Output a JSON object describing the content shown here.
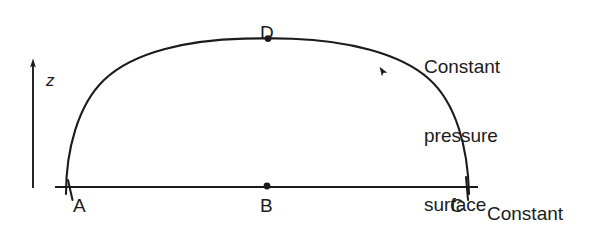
{
  "figure": {
    "type": "schematic-diagram",
    "background_color": "#ffffff",
    "ink_color": "#1b1b1b",
    "width": 606,
    "height": 229
  },
  "axis": {
    "name": "vertical-height-axis",
    "label": "z",
    "orientation": "vertical",
    "arrow_direction": "up",
    "x": 33,
    "y_top": 60,
    "y_bottom": 188,
    "label_x": 46,
    "label_y": 72
  },
  "baseline": {
    "name": "constant-height-surface-line",
    "x_start": 55,
    "x_end": 478,
    "y": 187
  },
  "curve": {
    "name": "constant-pressure-surface-curve",
    "description": "dome-shaped arc from A through D to C",
    "x_left": 70,
    "x_right": 466,
    "y_base": 193,
    "apex_x": 268,
    "apex_y": 58
  },
  "direction_marker": {
    "name": "flow-direction-arrowhead",
    "x": 383,
    "y": 71,
    "rotation_deg": -32
  },
  "points": [
    {
      "id": "A",
      "label": "A",
      "name": "point-a",
      "marker": "crossing",
      "x": 70,
      "y": 187,
      "label_x": 73,
      "label_y": 196,
      "on": "constant-height-surface"
    },
    {
      "id": "B",
      "label": "B",
      "name": "point-b",
      "marker": "dot",
      "x": 267,
      "y": 186,
      "label_x": 260,
      "label_y": 196,
      "on": "constant-height-surface"
    },
    {
      "id": "C",
      "label": "C",
      "name": "point-c",
      "marker": "crossing",
      "x": 466,
      "y": 187,
      "label_x": 450,
      "label_y": 196,
      "on": "constant-height-surface"
    },
    {
      "id": "D",
      "label": "D",
      "name": "point-d",
      "marker": "dot",
      "x": 268,
      "y": 58,
      "label_x": 260,
      "label_y": 23,
      "on": "constant-pressure-surface"
    }
  ],
  "annotations": [
    {
      "name": "constant-pressure-surface-label",
      "lines": [
        "Constant",
        "pressure",
        "surface"
      ],
      "x": 424,
      "y": 9,
      "refers_to": "curve"
    },
    {
      "name": "constant-height-surface-label",
      "lines": [
        "Constant",
        "height",
        "surface"
      ],
      "x": 487,
      "y": 156,
      "refers_to": "baseline"
    }
  ]
}
